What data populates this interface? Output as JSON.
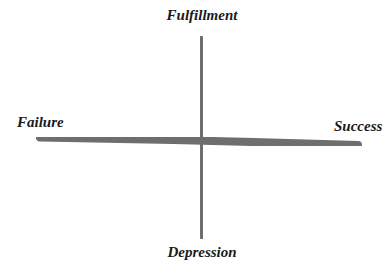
{
  "diagram": {
    "type": "quadrant-axes",
    "axes": {
      "vertical": {
        "top_label": "Fulfillment",
        "bottom_label": "Depression"
      },
      "horizontal": {
        "left_label": "Failure",
        "right_label": "Success"
      }
    },
    "colors": {
      "axis_stroke": "#6e6e6e",
      "label_text": "#1a1a1a",
      "background": "#ffffff"
    }
  }
}
